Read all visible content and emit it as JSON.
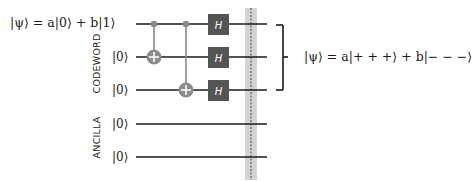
{
  "diagram": {
    "input_state": "|ψ⟩ = a|0⟩ + b|1⟩",
    "output_state": "|ψ⟩ =  a|+ + +⟩ + b|− − −⟩",
    "register_labels": {
      "codeword": "CODEWORD",
      "ancilla": "ANCILLA"
    },
    "qubit_labels": [
      "|0⟩",
      "|0⟩",
      "|0⟩",
      "|0⟩"
    ],
    "gates": [
      {
        "type": "CNOT",
        "control": 0,
        "target": 1
      },
      {
        "type": "CNOT",
        "control": 0,
        "target": 2
      },
      {
        "type": "H",
        "qubit": 0,
        "label": "H"
      },
      {
        "type": "H",
        "qubit": 1,
        "label": "H"
      },
      {
        "type": "H",
        "qubit": 2,
        "label": "H"
      }
    ],
    "barrier": "dashed vertical line across all qubits",
    "colors": {
      "wire": "#1a1a1a",
      "control": "#8c8c8c",
      "gate_fill": "#555555",
      "barrier_band": "#d0d0d0",
      "bracket": "#1a1a1a"
    }
  }
}
